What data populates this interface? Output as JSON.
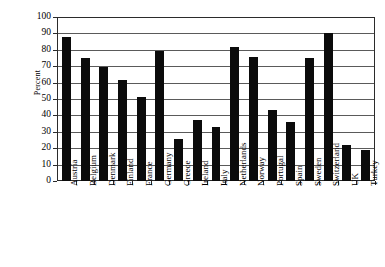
{
  "chart_data": {
    "type": "bar",
    "title": "",
    "subtitle": "",
    "xlabel": "",
    "ylabel": "Percent",
    "ylim": [
      0,
      100
    ],
    "y_ticks": [
      0,
      10,
      20,
      30,
      40,
      50,
      60,
      70,
      80,
      90,
      100
    ],
    "grid": true,
    "legend": "none",
    "bar_color": "#0b0b0b",
    "axis_color": "#2b2b2b",
    "categories": [
      "Austria",
      "Belgium",
      "Denmark",
      "Finland",
      "France",
      "Germany",
      "Greece",
      "Ireland",
      "Italy",
      "Netherlands",
      "Norway",
      "Portugal",
      "Spain",
      "Sweden",
      "Switzerland",
      "UK",
      "Turkey"
    ],
    "values": [
      88,
      75,
      69.5,
      61.5,
      51.5,
      79,
      25.5,
      37,
      33,
      81.5,
      75.5,
      43,
      36,
      75,
      90,
      22,
      19
    ]
  }
}
